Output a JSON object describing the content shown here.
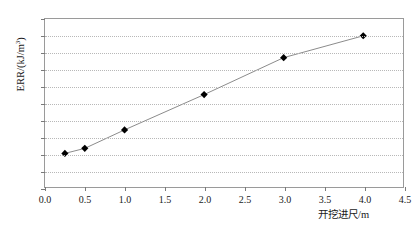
{
  "chart_data": {
    "type": "line",
    "title": "",
    "subtitle": "",
    "xlabel": "开挖进尺/m",
    "ylabel": "ERR/(kJ/m³)",
    "ylabel_base": "ERR/(kJ/m",
    "ylabel_sup": "3",
    "ylabel_tail": ")",
    "xlim": [
      0.0,
      4.5
    ],
    "ylim": [
      150,
      200
    ],
    "xticks": [
      "0.0",
      "0.5",
      "1.0",
      "1.5",
      "2.0",
      "2.5",
      "3.0",
      "3.5",
      "4.0",
      "4.5"
    ],
    "xtick_values": [
      0.0,
      0.5,
      1.0,
      1.5,
      2.0,
      2.5,
      3.0,
      3.5,
      4.0,
      4.5
    ],
    "yticks": [
      "150",
      "155",
      "160",
      "165",
      "170",
      "175",
      "180",
      "185",
      "190",
      "195",
      "200"
    ],
    "ytick_values": [
      150,
      155,
      160,
      165,
      170,
      175,
      180,
      185,
      190,
      195,
      200
    ],
    "grid": "horizontal-dotted",
    "legend": null,
    "legend_position": "none",
    "marker": "diamond",
    "marker_color": "#000000",
    "line_color": "#8a8a8a",
    "grid_color": "#b8b8b8",
    "frame_color": "#9a9a9a",
    "series": [
      {
        "name": "ERR",
        "x": [
          0.25,
          0.5,
          1.0,
          2.0,
          3.0,
          4.0
        ],
        "values": [
          160.0,
          161.5,
          167.0,
          177.5,
          188.5,
          195.0
        ]
      }
    ]
  }
}
